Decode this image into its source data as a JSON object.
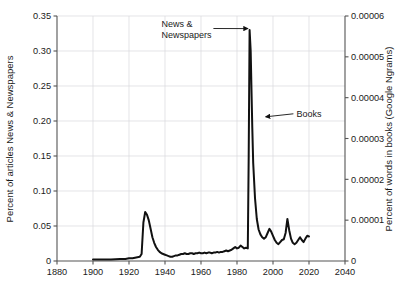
{
  "chart_data": {
    "type": "line",
    "title": "",
    "xlabel": "",
    "ylabel": "Percent of articles News & Newspapers",
    "ylabel_right": "Percent of words in books (Google Ngrams)",
    "xlim": [
      1880,
      2040
    ],
    "ylim": [
      0,
      0.35
    ],
    "ylim_right": [
      0,
      6e-05
    ],
    "grid": true,
    "legend": "annotations",
    "xticks": [
      1880,
      1900,
      1920,
      1940,
      1960,
      1980,
      2000,
      2020,
      2040
    ],
    "xtick_labels": [
      "1880",
      "1900",
      "1920",
      "1940",
      "1960",
      "1980",
      "2000",
      "2020",
      "2040"
    ],
    "yticks": [
      0,
      0.05,
      0.1,
      0.15,
      0.2,
      0.25,
      0.3,
      0.35
    ],
    "ytick_labels": [
      "0",
      "0.05",
      "0.10",
      "0.15",
      "0.20",
      "0.25",
      "0.30",
      "0.35"
    ],
    "yticks_right": [
      0,
      1e-05,
      2e-05,
      3e-05,
      4e-05,
      5e-05,
      6e-05
    ],
    "ytick_labels_right": [
      "0",
      "0.00001",
      "0.00002",
      "0.00003",
      "0.00004",
      "0.00005",
      "0.00006"
    ],
    "annotations": [
      {
        "text_line1": "News &",
        "text_line2": "Newspapers",
        "x": 1938,
        "y": 0.335,
        "arrow_to_x": 1986,
        "arrow_to_y": 0.332
      },
      {
        "text_line1": "Books",
        "text_line2": "",
        "x": 2013,
        "y": 0.206,
        "arrow_to_x": 1996,
        "arrow_to_y": 0.206
      }
    ],
    "series": [
      {
        "name": "News & Newspapers",
        "axis": "left",
        "color": "#111111",
        "width": 2.0,
        "points": [
          [
            1900,
            0.002
          ],
          [
            1905,
            0.002
          ],
          [
            1910,
            0.002
          ],
          [
            1915,
            0.003
          ],
          [
            1918,
            0.003
          ],
          [
            1920,
            0.004
          ],
          [
            1922,
            0.004
          ],
          [
            1924,
            0.005
          ],
          [
            1926,
            0.006
          ],
          [
            1927,
            0.01
          ],
          [
            1928,
            0.055
          ],
          [
            1929,
            0.07
          ],
          [
            1930,
            0.066
          ],
          [
            1931,
            0.058
          ],
          [
            1932,
            0.046
          ],
          [
            1933,
            0.034
          ],
          [
            1934,
            0.026
          ],
          [
            1935,
            0.02
          ],
          [
            1936,
            0.016
          ],
          [
            1937,
            0.013
          ],
          [
            1938,
            0.011
          ],
          [
            1939,
            0.01
          ],
          [
            1940,
            0.009
          ],
          [
            1941,
            0.008
          ],
          [
            1942,
            0.007
          ],
          [
            1943,
            0.006
          ],
          [
            1944,
            0.006
          ],
          [
            1945,
            0.007
          ],
          [
            1946,
            0.008
          ],
          [
            1947,
            0.008
          ],
          [
            1948,
            0.009
          ],
          [
            1949,
            0.01
          ],
          [
            1950,
            0.01
          ],
          [
            1951,
            0.011
          ],
          [
            1952,
            0.01
          ],
          [
            1953,
            0.01
          ],
          [
            1954,
            0.011
          ],
          [
            1955,
            0.011
          ],
          [
            1956,
            0.01
          ],
          [
            1957,
            0.011
          ],
          [
            1958,
            0.011
          ],
          [
            1959,
            0.012
          ],
          [
            1960,
            0.011
          ],
          [
            1961,
            0.011
          ],
          [
            1962,
            0.012
          ],
          [
            1963,
            0.011
          ],
          [
            1964,
            0.012
          ],
          [
            1965,
            0.012
          ],
          [
            1966,
            0.011
          ],
          [
            1967,
            0.012
          ],
          [
            1968,
            0.012
          ],
          [
            1969,
            0.013
          ],
          [
            1970,
            0.012
          ],
          [
            1971,
            0.013
          ],
          [
            1972,
            0.013
          ],
          [
            1973,
            0.014
          ],
          [
            1974,
            0.015
          ],
          [
            1975,
            0.014
          ],
          [
            1976,
            0.015
          ],
          [
            1977,
            0.016
          ],
          [
            1978,
            0.018
          ],
          [
            1979,
            0.02
          ],
          [
            1980,
            0.018
          ],
          [
            1981,
            0.019
          ],
          [
            1982,
            0.022
          ],
          [
            1983,
            0.02
          ],
          [
            1984,
            0.018
          ],
          [
            1985,
            0.019
          ],
          [
            1986,
            0.018
          ],
          [
            1986.5,
            0.15
          ],
          [
            1987,
            0.33
          ],
          [
            1987.6,
            0.3
          ],
          [
            1988,
            0.25
          ],
          [
            1988.5,
            0.19
          ],
          [
            1989,
            0.14
          ],
          [
            1990,
            0.09
          ],
          [
            1991,
            0.06
          ],
          [
            1992,
            0.045
          ],
          [
            1993,
            0.038
          ],
          [
            1994,
            0.034
          ],
          [
            1995,
            0.032
          ],
          [
            1996,
            0.034
          ],
          [
            1997,
            0.04
          ],
          [
            1998,
            0.046
          ],
          [
            1999,
            0.042
          ],
          [
            2000,
            0.036
          ],
          [
            2001,
            0.03
          ],
          [
            2002,
            0.026
          ],
          [
            2003,
            0.024
          ],
          [
            2004,
            0.027
          ],
          [
            2005,
            0.03
          ],
          [
            2006,
            0.031
          ],
          [
            2007,
            0.04
          ],
          [
            2008,
            0.06
          ],
          [
            2009,
            0.044
          ],
          [
            2010,
            0.032
          ],
          [
            2011,
            0.026
          ],
          [
            2012,
            0.024
          ],
          [
            2013,
            0.026
          ],
          [
            2014,
            0.03
          ],
          [
            2015,
            0.034
          ],
          [
            2016,
            0.03
          ],
          [
            2017,
            0.027
          ],
          [
            2018,
            0.032
          ],
          [
            2019,
            0.036
          ],
          [
            2020,
            0.035
          ]
        ]
      },
      {
        "name": "Books",
        "axis": "right",
        "color": "#111111",
        "width": 0.9,
        "points": [
          [
            1928,
            0.049
          ],
          [
            1929,
            0.058
          ],
          [
            1930,
            0.073
          ],
          [
            1931,
            0.09
          ],
          [
            1932,
            0.112
          ],
          [
            1933,
            0.122
          ],
          [
            1934,
            0.098
          ],
          [
            1935,
            0.083
          ],
          [
            1936,
            0.08
          ],
          [
            1937,
            0.076
          ],
          [
            1938,
            0.08
          ],
          [
            1939,
            0.084
          ],
          [
            1940,
            0.079
          ],
          [
            1941,
            0.086
          ],
          [
            1942,
            0.102
          ],
          [
            1943,
            0.083
          ],
          [
            1944,
            0.066
          ],
          [
            1945,
            0.06
          ],
          [
            1946,
            0.072
          ],
          [
            1947,
            0.09
          ],
          [
            1948,
            0.078
          ],
          [
            1949,
            0.063
          ],
          [
            1950,
            0.073
          ],
          [
            1951,
            0.085
          ],
          [
            1952,
            0.07
          ],
          [
            1953,
            0.062
          ],
          [
            1954,
            0.074
          ],
          [
            1955,
            0.088
          ],
          [
            1956,
            0.103
          ],
          [
            1957,
            0.086
          ],
          [
            1958,
            0.07
          ],
          [
            1959,
            0.062
          ],
          [
            1960,
            0.074
          ],
          [
            1961,
            0.086
          ],
          [
            1962,
            0.07
          ],
          [
            1963,
            0.062
          ],
          [
            1964,
            0.075
          ],
          [
            1965,
            0.09
          ],
          [
            1966,
            0.078
          ],
          [
            1967,
            0.07
          ],
          [
            1968,
            0.082
          ],
          [
            1969,
            0.092
          ],
          [
            1970,
            0.08
          ],
          [
            1971,
            0.074
          ],
          [
            1972,
            0.086
          ],
          [
            1973,
            0.095
          ],
          [
            1974,
            0.086
          ],
          [
            1975,
            0.08
          ],
          [
            1976,
            0.092
          ],
          [
            1977,
            0.103
          ],
          [
            1978,
            0.094
          ],
          [
            1979,
            0.086
          ],
          [
            1980,
            0.096
          ],
          [
            1981,
            0.106
          ],
          [
            1982,
            0.092
          ],
          [
            1983,
            0.083
          ],
          [
            1984,
            0.095
          ],
          [
            1985,
            0.11
          ],
          [
            1986,
            0.132
          ],
          [
            1987,
            0.33
          ],
          [
            1988,
            0.3
          ],
          [
            1989,
            0.282
          ],
          [
            1990,
            0.268
          ],
          [
            1991,
            0.252
          ],
          [
            1992,
            0.24
          ],
          [
            1993,
            0.232
          ],
          [
            1994,
            0.222
          ],
          [
            1995,
            0.228
          ],
          [
            1996,
            0.216
          ],
          [
            1997,
            0.205
          ],
          [
            1998,
            0.196
          ],
          [
            1999,
            0.205
          ],
          [
            2000,
            0.212
          ],
          [
            2001,
            0.198
          ],
          [
            2002,
            0.186
          ],
          [
            2003,
            0.196
          ],
          [
            2004,
            0.206
          ],
          [
            2005,
            0.212
          ],
          [
            2006,
            0.2
          ],
          [
            2007,
            0.186
          ],
          [
            2008,
            0.196
          ],
          [
            2009,
            0.178
          ],
          [
            2010,
            0.162
          ]
        ]
      }
    ]
  },
  "caption": ""
}
